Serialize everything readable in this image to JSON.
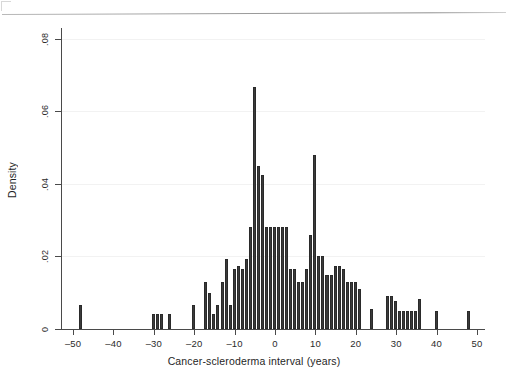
{
  "chart_data": {
    "type": "bar",
    "title": "",
    "subtitle": "",
    "xlabel": "Cancer-scleroderma interval (years)",
    "ylabel": "Density",
    "xlim": [
      -53,
      52
    ],
    "ylim": [
      0,
      0.083
    ],
    "xticks": [
      -50,
      -40,
      -30,
      -20,
      -10,
      0,
      10,
      20,
      30,
      40,
      50
    ],
    "xtick_labels": [
      "–50",
      "–40",
      "–30",
      "–20",
      "–10",
      "0",
      "10",
      "20",
      "30",
      "40",
      "50"
    ],
    "yticks": [
      0,
      0.02,
      0.04,
      0.06,
      0.08
    ],
    "ytick_labels": [
      "0",
      ".02",
      ".04",
      ".06",
      ".08"
    ],
    "grid": "horizontal-faint",
    "legend": "none",
    "bar_color": "#3b3b3b",
    "bin_width": 1,
    "categories": [
      -48,
      -30,
      -29,
      -28,
      -26,
      -20,
      -17,
      -16,
      -15,
      -14,
      -13,
      -12,
      -11,
      -10,
      -9,
      -8,
      -7,
      -6,
      -5,
      -4,
      -3,
      -2,
      -1,
      0,
      1,
      2,
      3,
      4,
      5,
      6,
      7,
      8,
      9,
      10,
      11,
      12,
      13,
      14,
      15,
      16,
      17,
      18,
      19,
      20,
      21,
      24,
      28,
      29,
      30,
      31,
      32,
      33,
      34,
      35,
      36,
      40,
      48
    ],
    "values": [
      0.0065,
      0.0042,
      0.0042,
      0.0042,
      0.0042,
      0.0065,
      0.013,
      0.01,
      0.0042,
      0.0065,
      0.013,
      0.0194,
      0.0065,
      0.0165,
      0.0175,
      0.0165,
      0.0194,
      0.028,
      0.0667,
      0.045,
      0.0425,
      0.028,
      0.028,
      0.028,
      0.028,
      0.028,
      0.028,
      0.0165,
      0.0165,
      0.013,
      0.013,
      0.0165,
      0.026,
      0.048,
      0.02,
      0.02,
      0.0148,
      0.0148,
      0.0175,
      0.0175,
      0.0165,
      0.013,
      0.013,
      0.013,
      0.011,
      0.0055,
      0.009,
      0.009,
      0.0078,
      0.005,
      0.005,
      0.005,
      0.005,
      0.005,
      0.0082,
      0.005,
      0.005
    ]
  },
  "page": {
    "axis_title_x": "Cancer-scleroderma interval (years)",
    "axis_title_y": "Density"
  }
}
